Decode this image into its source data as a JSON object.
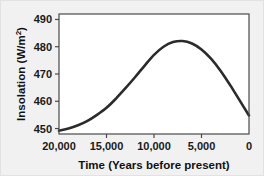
{
  "chart_data": {
    "type": "line",
    "title": "",
    "xlabel": "Time (Years before present)",
    "ylabel": "Insolation (W/m2)",
    "ylabel_base": "Insolation (W/m",
    "ylabel_sup": "2",
    "ylabel_close": ")",
    "xlim": [
      20000,
      0
    ],
    "ylim": [
      448,
      492
    ],
    "x_axis_inverted": true,
    "grid": false,
    "legend": null,
    "xticks": [
      20000,
      15000,
      10000,
      5000,
      0
    ],
    "xticklabels": [
      "20,000",
      "15,000",
      "10,000",
      "5,000",
      "0"
    ],
    "yticks": [
      450,
      460,
      470,
      480,
      490
    ],
    "yticklabels": [
      "450",
      "460",
      "470",
      "480",
      "490"
    ],
    "series": [
      {
        "name": "Northern Hemisphere summer insolation",
        "color": "#2b2b2b",
        "linewidth": 2.6,
        "x": [
          20000,
          19000,
          18000,
          17000,
          16000,
          15000,
          14000,
          13000,
          12000,
          11000,
          10000,
          9000,
          8000,
          7000,
          6000,
          5000,
          4000,
          3000,
          2000,
          1000,
          0
        ],
        "values": [
          449.2,
          450.0,
          451.2,
          452.8,
          455.0,
          457.6,
          461.0,
          464.8,
          468.8,
          473.0,
          477.0,
          480.0,
          481.7,
          482.1,
          481.2,
          479.0,
          475.6,
          471.2,
          466.0,
          460.4,
          454.8
        ]
      }
    ]
  },
  "figure": {
    "background_color": "#f1f1f1",
    "plot_background_color": "#ffffff",
    "frame_color": "#4a4a4a",
    "tick_color": "#4a4a4a"
  }
}
